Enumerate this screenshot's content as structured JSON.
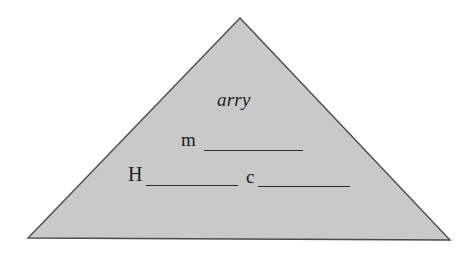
{
  "figure": {
    "type": "triangle-diagram",
    "background_color": "#ffffff",
    "shape": {
      "name": "triangle",
      "fill_color": "#c9c9c9",
      "stroke_color": "#4a4a4a",
      "stroke_width": 1.4,
      "points": "240,18 450,240 28,238"
    }
  },
  "labels": {
    "arry": "arry",
    "m": "m",
    "H": "H",
    "c": "c"
  },
  "blanks": {
    "after_m": "",
    "after_H": "",
    "after_c": ""
  }
}
